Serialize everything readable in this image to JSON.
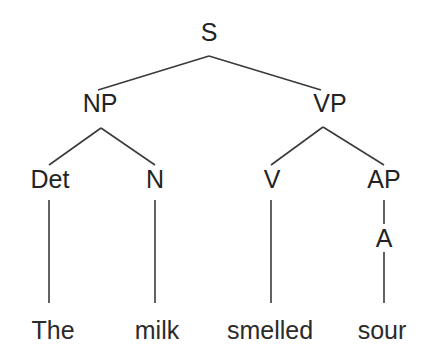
{
  "figure": {
    "type": "constituency-parse-tree",
    "sentence": "The milk smelled sour",
    "background_color": "#ffffff",
    "line_color": "#3a3a3a",
    "text_color": "#232323"
  },
  "nodes": [
    {
      "id": "S",
      "label": "S",
      "x": 209,
      "y": 32,
      "kind": "phrase"
    },
    {
      "id": "NP",
      "label": "NP",
      "x": 100,
      "y": 103,
      "kind": "phrase"
    },
    {
      "id": "VP",
      "label": "VP",
      "x": 330,
      "y": 103,
      "kind": "phrase"
    },
    {
      "id": "Det",
      "label": "Det",
      "x": 50,
      "y": 179,
      "kind": "pos"
    },
    {
      "id": "N",
      "label": "N",
      "x": 155,
      "y": 179,
      "kind": "pos"
    },
    {
      "id": "V",
      "label": "V",
      "x": 272,
      "y": 179,
      "kind": "pos"
    },
    {
      "id": "AP",
      "label": "AP",
      "x": 384,
      "y": 179,
      "kind": "phrase"
    },
    {
      "id": "A",
      "label": "A",
      "x": 384,
      "y": 238,
      "kind": "pos"
    }
  ],
  "leaves": [
    {
      "id": "w1",
      "label": "The",
      "x": 53,
      "y": 330
    },
    {
      "id": "w2",
      "label": "milk",
      "x": 157,
      "y": 330
    },
    {
      "id": "w3",
      "label": "smelled",
      "x": 270,
      "y": 330
    },
    {
      "id": "w4",
      "label": "sour",
      "x": 382,
      "y": 330
    }
  ],
  "edges": [
    {
      "from": "S",
      "to": "NP",
      "x1": 209,
      "y1": 56,
      "x2": 98,
      "y2": 90
    },
    {
      "from": "S",
      "to": "VP",
      "x1": 209,
      "y1": 56,
      "x2": 321,
      "y2": 90
    },
    {
      "from": "NP",
      "to": "Det",
      "x1": 101,
      "y1": 128,
      "x2": 49,
      "y2": 165
    },
    {
      "from": "NP",
      "to": "N",
      "x1": 101,
      "y1": 128,
      "x2": 155,
      "y2": 165
    },
    {
      "from": "VP",
      "to": "V",
      "x1": 323,
      "y1": 127,
      "x2": 271,
      "y2": 165
    },
    {
      "from": "VP",
      "to": "AP",
      "x1": 323,
      "y1": 127,
      "x2": 384,
      "y2": 165
    },
    {
      "from": "Det",
      "to": "w1",
      "x1": 49,
      "y1": 200,
      "x2": 49,
      "y2": 303
    },
    {
      "from": "N",
      "to": "w2",
      "x1": 155,
      "y1": 200,
      "x2": 155,
      "y2": 303
    },
    {
      "from": "V",
      "to": "w3",
      "x1": 271,
      "y1": 200,
      "x2": 271,
      "y2": 303
    },
    {
      "from": "AP",
      "to": "A",
      "x1": 384,
      "y1": 200,
      "x2": 384,
      "y2": 224
    },
    {
      "from": "A",
      "to": "w4",
      "x1": 384,
      "y1": 252,
      "x2": 384,
      "y2": 303
    }
  ]
}
